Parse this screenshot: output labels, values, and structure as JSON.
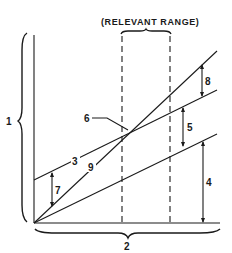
{
  "title": "(RELEVANT RANGE)",
  "labels": {
    "l1": "1",
    "l2": "2",
    "l3": "3",
    "l4": "4",
    "l5": "5",
    "l6": "6",
    "l7": "7",
    "l8": "8",
    "l9": "9"
  },
  "colors": {
    "ink": "#1a1a1a",
    "background": "#ffffff"
  }
}
